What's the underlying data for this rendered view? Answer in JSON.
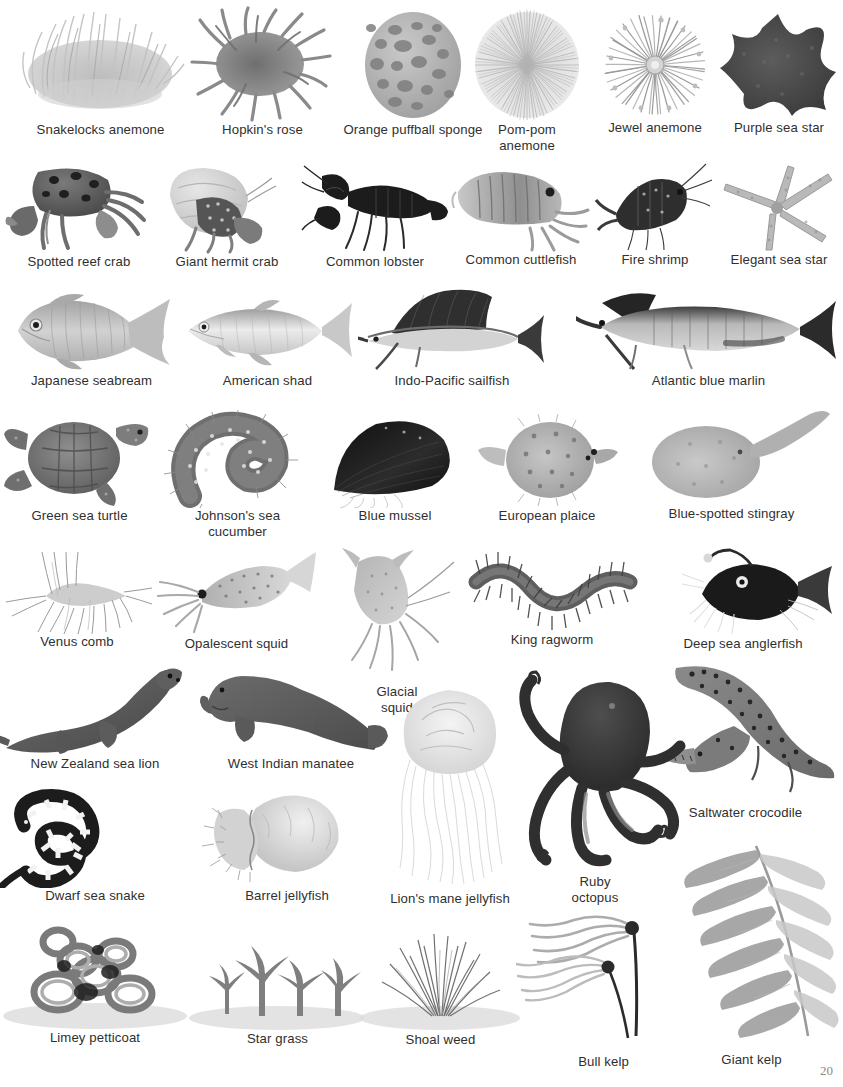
{
  "page": {
    "page_number": "20",
    "background_color": "#ffffff",
    "text_color": "#2f2f2f"
  },
  "rows": [
    {
      "id": "row-invertebrates-1",
      "items": [
        {
          "label": "Snakelocks anemone",
          "art": "snakelocks-anemone"
        },
        {
          "label": "Hopkin's rose",
          "art": "hopkins-rose"
        },
        {
          "label": "Orange puffball sponge",
          "art": "orange-puffball-sponge"
        },
        {
          "label": "Pom-pom\nanemone",
          "art": "pom-pom-anemone"
        },
        {
          "label": "Jewel anemone",
          "art": "jewel-anemone"
        },
        {
          "label": "Purple sea star",
          "art": "purple-sea-star"
        }
      ]
    },
    {
      "id": "row-crustaceans",
      "items": [
        {
          "label": "Spotted reef crab",
          "art": "spotted-reef-crab"
        },
        {
          "label": "Giant hermit crab",
          "art": "giant-hermit-crab"
        },
        {
          "label": "Common lobster",
          "art": "common-lobster"
        },
        {
          "label": "Common cuttlefish",
          "art": "common-cuttlefish"
        },
        {
          "label": "Fire shrimp",
          "art": "fire-shrimp"
        },
        {
          "label": "Elegant sea star",
          "art": "elegant-sea-star"
        }
      ]
    },
    {
      "id": "row-fish",
      "items": [
        {
          "label": "Japanese seabream",
          "art": "japanese-seabream"
        },
        {
          "label": "American shad",
          "art": "american-shad"
        },
        {
          "label": "Indo-Pacific sailfish",
          "art": "indo-pacific-sailfish"
        },
        {
          "label": "Atlantic blue marlin",
          "art": "atlantic-blue-marlin"
        }
      ]
    },
    {
      "id": "row-reptiles-molluscs",
      "items": [
        {
          "label": "Green sea turtle",
          "art": "green-sea-turtle"
        },
        {
          "label": "Johnson's sea\ncucumber",
          "art": "johnsons-sea-cucumber"
        },
        {
          "label": "Blue mussel",
          "art": "blue-mussel"
        },
        {
          "label": "European plaice",
          "art": "european-plaice"
        },
        {
          "label": "Blue-spotted stingray",
          "art": "blue-spotted-stingray"
        }
      ]
    },
    {
      "id": "row-cephalopods-worms",
      "items": [
        {
          "label": "Venus comb",
          "art": "venus-comb"
        },
        {
          "label": "Opalescent squid",
          "art": "opalescent-squid"
        },
        {
          "label": "Glacial\nsquid",
          "art": "glacial-squid"
        },
        {
          "label": "King ragworm",
          "art": "king-ragworm"
        },
        {
          "label": "Deep sea anglerfish",
          "art": "deep-sea-anglerfish"
        }
      ]
    },
    {
      "id": "row-mammals",
      "items": [
        {
          "label": "New Zealand sea lion",
          "art": "new-zealand-sea-lion"
        },
        {
          "label": "West Indian manatee",
          "art": "west-indian-manatee"
        },
        {
          "label": "Saltwater crocodile",
          "art": "saltwater-crocodile"
        }
      ]
    },
    {
      "id": "row-jellyfish-octopus",
      "items": [
        {
          "label": "Dwarf sea snake",
          "art": "dwarf-sea-snake"
        },
        {
          "label": "Barrel jellyfish",
          "art": "barrel-jellyfish"
        },
        {
          "label": "Lion's mane jellyfish",
          "art": "lions-mane-jellyfish"
        },
        {
          "label": "Ruby\noctopus",
          "art": "ruby-octopus"
        }
      ]
    },
    {
      "id": "row-plants-algae",
      "items": [
        {
          "label": "Limey petticoat",
          "art": "limey-petticoat"
        },
        {
          "label": "Star grass",
          "art": "star-grass"
        },
        {
          "label": "Shoal weed",
          "art": "shoal-weed"
        },
        {
          "label": "Bull kelp",
          "art": "bull-kelp"
        },
        {
          "label": "Giant kelp",
          "art": "giant-kelp"
        }
      ]
    }
  ]
}
